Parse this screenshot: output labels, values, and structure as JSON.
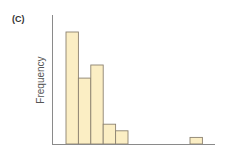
{
  "panel_label": "(C)",
  "chart_data": {
    "type": "bar",
    "title": "",
    "panel": "(C)",
    "xlabel": "",
    "ylabel": "Frequency",
    "categories": [
      "bin1",
      "bin2",
      "bin3",
      "bin4",
      "bin5",
      "bin6",
      "bin7",
      "bin8",
      "bin9",
      "bin10",
      "bin11",
      "bin12"
    ],
    "values": [
      17,
      10,
      12,
      3,
      2,
      0,
      0,
      0,
      0,
      0,
      1,
      0
    ],
    "ylim": [
      0,
      19
    ],
    "grid": false,
    "legend": null,
    "colors": {
      "fill": "#fbeec4",
      "outline": "#8c8270",
      "axis": "#8a8a8a"
    }
  }
}
